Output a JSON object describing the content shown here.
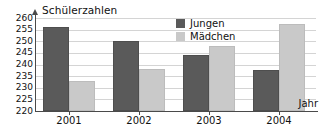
{
  "chart_data": {
    "type": "bar",
    "title": "Schülerzahlen",
    "xlabel": "Jahr",
    "ylabel": "Schülerzahlen",
    "categories": [
      "2001",
      "2002",
      "2003",
      "2004"
    ],
    "series": [
      {
        "name": "Jungen",
        "color": "#5a5a5a",
        "values": [
          256,
          250,
          244,
          237.5
        ]
      },
      {
        "name": "Mädchen",
        "color": "#c9c9c9",
        "values": [
          233,
          238,
          248,
          257.5
        ]
      }
    ],
    "ylim": [
      220,
      260
    ],
    "yticks": [
      220,
      225,
      230,
      235,
      240,
      245,
      250,
      255,
      260
    ],
    "grid": true,
    "legend_position": "top-right"
  },
  "legend": {
    "entries": [
      {
        "label": "Jungen"
      },
      {
        "label": "Mädchen"
      }
    ]
  },
  "axes": {
    "x_name": "Jahr",
    "y_name": "Schülerzahlen"
  },
  "colors": {
    "jungen": "#5a5a5a",
    "maedchen": "#c9c9c9",
    "grid": "#d4d4d4",
    "axis": "#4a4a4a",
    "background": "#ffffff"
  }
}
